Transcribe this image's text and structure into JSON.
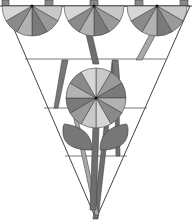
{
  "figure": {
    "colors": {
      "background": "#ffffff",
      "outline": "#444444",
      "band_light": "#f4f4f4",
      "stem_dark": "#6e6e6e",
      "stem_light": "#a8a8a8",
      "leaf": "#777777",
      "petal_shades": [
        "#c8c8c8",
        "#9a9a9a",
        "#7a7a7a",
        "#b2b2b2",
        "#8a8a8a",
        "#d6d6d6"
      ]
    },
    "flowers": [
      {
        "name": "top-left-half-flower",
        "cx": 32,
        "cy": 6,
        "r": 30,
        "half": true
      },
      {
        "name": "top-center-half-flower",
        "cx": 94,
        "cy": 6,
        "r": 30,
        "half": true
      },
      {
        "name": "top-right-half-flower",
        "cx": 157,
        "cy": 6,
        "r": 30,
        "half": true
      },
      {
        "name": "center-full-flower",
        "cx": 96,
        "cy": 98,
        "r": 30,
        "half": false
      }
    ],
    "petal_count_full": 12,
    "petal_count_half": 6
  }
}
